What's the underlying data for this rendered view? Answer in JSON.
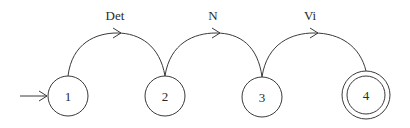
{
  "diagram": {
    "type": "finite-state-automaton",
    "colors": {
      "stroke": "#3a3a3a",
      "text": "#2a2a2a",
      "background": "#ffffff"
    },
    "start_state": "1",
    "states": [
      {
        "id": "1",
        "label": "1",
        "accepting": false
      },
      {
        "id": "2",
        "label": "2",
        "accepting": false
      },
      {
        "id": "3",
        "label": "3",
        "accepting": false
      },
      {
        "id": "4",
        "label": "4",
        "accepting": true
      }
    ],
    "transitions": [
      {
        "from": "1",
        "to": "2",
        "label": "Det"
      },
      {
        "from": "2",
        "to": "3",
        "label": "N"
      },
      {
        "from": "3",
        "to": "4",
        "label": "Vi"
      }
    ]
  }
}
